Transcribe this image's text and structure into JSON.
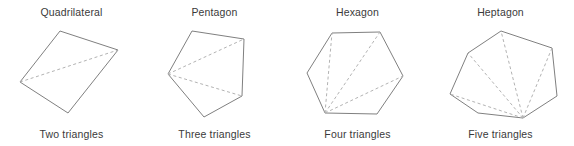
{
  "figure": {
    "background_color": "#ffffff",
    "outline_color": "#808080",
    "diagonal_color": "#b3b3b3",
    "text_color": "#3a3a3a"
  },
  "panels": [
    {
      "title": "Quadrilateral",
      "caption": "Two triangles",
      "sides": 4,
      "triangles": 2,
      "diagonals": 1,
      "outline_points": "60,31 118,50 68,113 20,82",
      "diagonal_paths": [
        "M 20,82 L 118,50"
      ]
    },
    {
      "title": "Pentagon",
      "caption": "Three triangles",
      "sides": 5,
      "triangles": 3,
      "diagonals": 2,
      "outline_points": "192,31 244,39 242,96 204,117 168,74",
      "diagonal_paths": [
        "M 168,74 L 244,39",
        "M 168,74 L 242,96"
      ]
    },
    {
      "title": "Hexagon",
      "caption": "Four triangles",
      "sides": 6,
      "triangles": 4,
      "diagonals": 3,
      "outline_points": "332,33 380,32 403,76 377,114 325,113 307,73",
      "diagonal_paths": [
        "M 325,113 L 332,33",
        "M 325,113 L 380,32",
        "M 325,113 L 403,76"
      ]
    },
    {
      "title": "Heptagon",
      "caption": "Five triangles",
      "sides": 7,
      "triangles": 5,
      "diagonals": 4,
      "outline_points": "501,31 552,48 557,96 523,118 478,113 450,94 468,53",
      "diagonal_paths": [
        "M 523,118 L 468,53",
        "M 523,118 L 450,94",
        "M 523,118 L 501,31",
        "M 523,118 L 552,48"
      ]
    }
  ]
}
